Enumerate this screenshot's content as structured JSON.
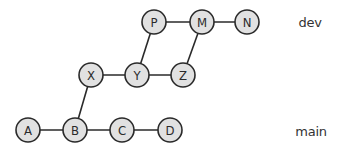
{
  "diagram": {
    "type": "git-commit-graph",
    "nodes": [
      {
        "id": "A",
        "label": "A",
        "x": 28,
        "y": 130,
        "branch": "main"
      },
      {
        "id": "B",
        "label": "B",
        "x": 75,
        "y": 130,
        "branch": "main"
      },
      {
        "id": "C",
        "label": "C",
        "x": 122,
        "y": 130,
        "branch": "main"
      },
      {
        "id": "D",
        "label": "D",
        "x": 170,
        "y": 130,
        "branch": "main"
      },
      {
        "id": "X",
        "label": "X",
        "x": 91,
        "y": 75,
        "branch": "feature"
      },
      {
        "id": "Y",
        "label": "Y",
        "x": 137,
        "y": 75,
        "branch": "feature"
      },
      {
        "id": "Z",
        "label": "Z",
        "x": 183,
        "y": 75,
        "branch": "feature"
      },
      {
        "id": "P",
        "label": "P",
        "x": 154,
        "y": 22,
        "branch": "dev"
      },
      {
        "id": "M",
        "label": "M",
        "x": 202,
        "y": 22,
        "branch": "dev"
      },
      {
        "id": "N",
        "label": "N",
        "x": 247,
        "y": 22,
        "branch": "dev"
      }
    ],
    "edges": [
      [
        "A",
        "B"
      ],
      [
        "B",
        "C"
      ],
      [
        "C",
        "D"
      ],
      [
        "B",
        "X"
      ],
      [
        "X",
        "Y"
      ],
      [
        "Y",
        "Z"
      ],
      [
        "Y",
        "P"
      ],
      [
        "P",
        "M"
      ],
      [
        "M",
        "N"
      ],
      [
        "Z",
        "M"
      ]
    ],
    "node_radius": 12,
    "branch_labels": {
      "dev": "dev",
      "main": "main"
    },
    "colors": {
      "node_fill": "#e1e1e1",
      "stroke": "#2a2a2a",
      "label_text": "#333333"
    }
  }
}
